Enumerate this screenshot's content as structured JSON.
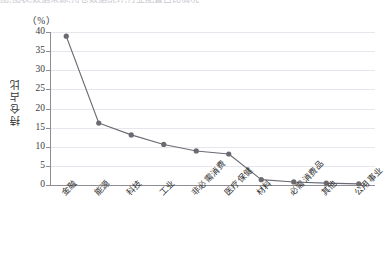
{
  "top_clip_text": "图,图表,数据来源,持仓数据统计,行业配置占比情况",
  "axis": {
    "unit_label": "（%）",
    "y_title": "持仓占比",
    "y_ticks": [
      "40",
      "35",
      "30",
      "25",
      "20",
      "15",
      "10",
      "5",
      "0"
    ]
  },
  "colors": {
    "line": "#6b6b73",
    "marker": "#6a6a72",
    "grid": "#e6e6ec",
    "axis": "#8d8d93"
  },
  "chart_data": {
    "type": "line",
    "title": "",
    "xlabel": "",
    "ylabel": "持仓占比",
    "unit": "%",
    "ylim": [
      0,
      40
    ],
    "yticks": [
      0,
      5,
      10,
      15,
      20,
      25,
      30,
      35,
      40
    ],
    "grid": true,
    "legend": "none",
    "categories": [
      "金融",
      "能源",
      "科技",
      "工业",
      "非必需消费",
      "医疗保健",
      "材料",
      "必需消费品",
      "其他",
      "公用事业"
    ],
    "values": [
      38.9,
      16.2,
      13.1,
      10.6,
      8.9,
      8.1,
      1.4,
      0.8,
      0.5,
      0.3
    ],
    "series": [
      {
        "name": "持仓占比",
        "values": [
          38.9,
          16.2,
          13.1,
          10.6,
          8.9,
          8.1,
          1.4,
          0.8,
          0.5,
          0.3
        ]
      }
    ]
  }
}
